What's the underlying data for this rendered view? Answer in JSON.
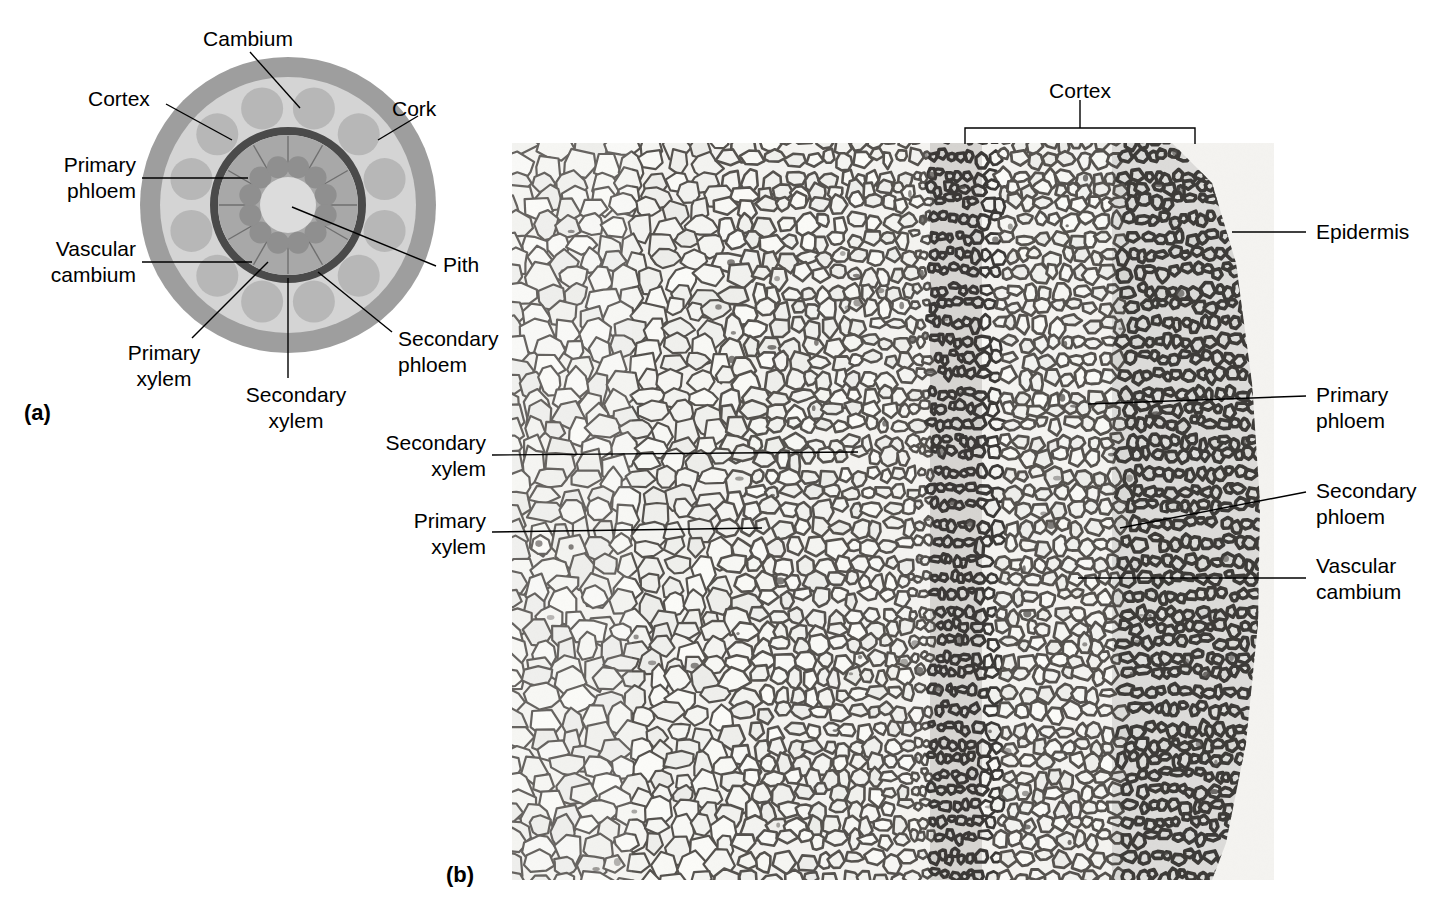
{
  "figure": {
    "panel_a_tag": "(a)",
    "panel_b_tag": "(b)"
  },
  "diagram": {
    "labels": {
      "cambium": "Cambium",
      "cortex": "Cortex",
      "cork": "Cork",
      "primary_phloem_l1": "Primary",
      "primary_phloem_l2": "phloem",
      "vascular_cambium_l1": "Vascular",
      "vascular_cambium_l2": "cambium",
      "pith": "Pith",
      "primary_xylem_l1": "Primary",
      "primary_xylem_l2": "xylem",
      "secondary_xylem_l1": "Secondary",
      "secondary_xylem_l2": "xylem",
      "secondary_phloem_l1": "Secondary",
      "secondary_phloem_l2": "phloem"
    },
    "rings": {
      "cork_color": "#9e9e9e",
      "cortex_color": "#d4d4d4",
      "phloem_lobe_color": "#b5b5b5",
      "cambium_ring_color": "#4a4a4a",
      "secondary_xylem_color": "#a8a8a8",
      "primary_xylem_color": "#8f8f8f",
      "pith_color": "#dcdcdc"
    },
    "geometry": {
      "center_x": 288,
      "center_y": 205,
      "cork_outer_r": 148,
      "cork_inner_r": 128,
      "cortex_r": 128,
      "cambium_outer_r": 78,
      "cambium_inner_r": 70,
      "sec_xylem_r": 70,
      "pith_r": 28,
      "bundle_count": 12
    }
  },
  "micrograph": {
    "labels": {
      "cortex": "Cortex",
      "epidermis": "Epidermis",
      "primary_phloem_l1": "Primary",
      "primary_phloem_l2": "phloem",
      "secondary_phloem_l1": "Secondary",
      "secondary_phloem_l2": "phloem",
      "vascular_cambium_l1": "Vascular",
      "vascular_cambium_l2": "cambium",
      "secondary_xylem_l1": "Secondary",
      "secondary_xylem_l2": "xylem",
      "primary_xylem_l1": "Primary",
      "primary_xylem_l2": "xylem"
    },
    "bracket": {
      "left_x": 965,
      "right_x": 1195,
      "y": 128,
      "tick_height": 16,
      "stem_top": 100
    },
    "frame": {
      "x": 512,
      "y": 143,
      "width": 762,
      "height": 737
    },
    "tone": {
      "background": "#f2f1ee",
      "cell_wall": "#4c4a47",
      "cell_lumen": "#f4f3f0"
    }
  },
  "leaders": {
    "color": "#000000",
    "width": 1.4
  }
}
